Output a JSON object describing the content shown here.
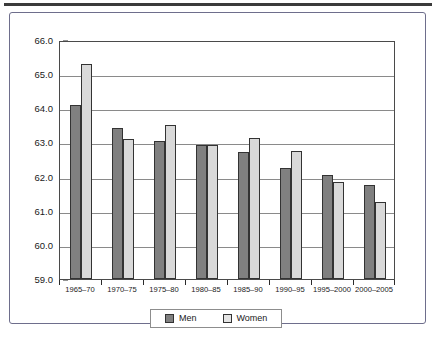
{
  "chart_data": {
    "type": "bar",
    "title": "",
    "subtitle": "",
    "xlabel": "",
    "ylabel": "",
    "categories": [
      "1965–70",
      "1970–75",
      "1975–80",
      "1980–85",
      "1985–90",
      "1990–95",
      "1995–2000",
      "2000–2005"
    ],
    "series": [
      {
        "name": "Men",
        "color": "#808080",
        "values": [
          64.11,
          63.41,
          63.03,
          62.92,
          62.73,
          62.24,
          62.06,
          61.76
        ]
      },
      {
        "name": "Women",
        "color": "#d9d9d9",
        "values": [
          65.31,
          63.11,
          63.52,
          62.92,
          63.13,
          62.74,
          61.85,
          61.26
        ]
      }
    ],
    "ylim": [
      59.0,
      66.0
    ],
    "y_ticks": [
      59.0,
      60.0,
      61.0,
      62.0,
      63.0,
      64.0,
      65.0,
      66.0
    ],
    "y_tick_labels": [
      "59.0",
      "60.0",
      "61.0",
      "62.0",
      "63.0",
      "64.0",
      "65.0",
      "66.0"
    ],
    "grid": true,
    "grid_axis": "y",
    "legend_position": "bottom-center",
    "legend_entries": [
      "Men",
      "Women"
    ],
    "annotations": []
  },
  "legend": {
    "men_label": "Men",
    "women_label": "Women"
  }
}
